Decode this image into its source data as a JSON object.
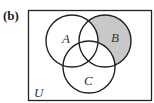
{
  "figure": {
    "part_label": "(b)",
    "universe_label": "U",
    "sets": [
      {
        "id": "A",
        "label": "A",
        "cx": 72,
        "cy": 41,
        "r": 26
      },
      {
        "id": "B",
        "label": "B",
        "cx": 105,
        "cy": 41,
        "r": 26
      },
      {
        "id": "C",
        "label": "C",
        "cx": 89,
        "cy": 67,
        "r": 26
      }
    ],
    "shaded_region": "B minus (A union C)",
    "colors": {
      "shade": "#c8c8c8",
      "stroke": "#222222",
      "background": "#ffffff"
    }
  }
}
